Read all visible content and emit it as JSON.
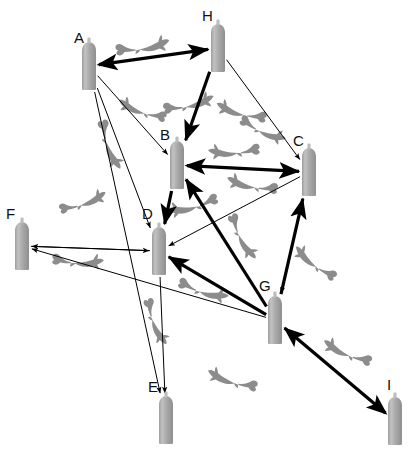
{
  "diagram": {
    "title": "",
    "kind": "directed-network-graph",
    "canvas": {
      "width": 414,
      "height": 449,
      "background": "#ffffff"
    },
    "style": {
      "node_fill": "#a6a6a6",
      "node_top_fill": "#bdbdbd",
      "edge_color": "#000000",
      "thin_edge_width": 1,
      "thick_edge_width": 3.2,
      "shark_color": "#8c8c8c",
      "label_color": "#111111"
    },
    "nodes": [
      {
        "id": "A",
        "label": "A",
        "x": 89,
        "y": 66,
        "label_x": 74,
        "label_y": 30
      },
      {
        "id": "B",
        "label": "B",
        "x": 177,
        "y": 165,
        "label_x": 160,
        "label_y": 127
      },
      {
        "id": "C",
        "label": "C",
        "x": 309,
        "y": 172,
        "label_x": 293,
        "label_y": 133
      },
      {
        "id": "D",
        "label": "D",
        "x": 159,
        "y": 251,
        "label_x": 142,
        "label_y": 206
      },
      {
        "id": "E",
        "label": "E",
        "x": 166,
        "y": 420,
        "label_x": 148,
        "label_y": 379
      },
      {
        "id": "F",
        "label": "F",
        "x": 22,
        "y": 246,
        "label_x": 6,
        "label_y": 206
      },
      {
        "id": "G",
        "label": "G",
        "x": 275,
        "y": 320,
        "label_x": 259,
        "label_y": 278
      },
      {
        "id": "H",
        "label": "H",
        "x": 218,
        "y": 48,
        "label_x": 202,
        "label_y": 8
      },
      {
        "id": "I",
        "label": "I",
        "x": 395,
        "y": 421,
        "label_x": 387,
        "label_y": 377
      }
    ],
    "edges": [
      {
        "from": "A",
        "to": "H",
        "weight": "thick",
        "arrows": "both"
      },
      {
        "from": "B",
        "to": "C",
        "weight": "thick",
        "arrows": "both"
      },
      {
        "from": "H",
        "to": "B",
        "weight": "thick",
        "arrows": "to"
      },
      {
        "from": "G",
        "to": "C",
        "weight": "thick",
        "arrows": "to"
      },
      {
        "from": "G",
        "to": "B",
        "weight": "thick",
        "arrows": "to"
      },
      {
        "from": "G",
        "to": "D",
        "weight": "thick",
        "arrows": "to"
      },
      {
        "from": "B",
        "to": "D",
        "weight": "thick",
        "arrows": "to"
      },
      {
        "from": "I",
        "to": "G",
        "weight": "thick",
        "arrows": "both"
      },
      {
        "from": "A",
        "to": "B",
        "weight": "thin",
        "arrows": "to"
      },
      {
        "from": "A",
        "to": "D",
        "weight": "thin",
        "arrows": "to"
      },
      {
        "from": "A",
        "to": "E",
        "weight": "thin",
        "arrows": "to"
      },
      {
        "from": "H",
        "to": "C",
        "weight": "thin",
        "arrows": "to"
      },
      {
        "from": "C",
        "to": "D",
        "weight": "thin",
        "arrows": "to"
      },
      {
        "from": "C",
        "to": "G",
        "weight": "thin",
        "arrows": "to"
      },
      {
        "from": "D",
        "to": "F",
        "weight": "thin",
        "arrows": "to"
      },
      {
        "from": "F",
        "to": "D",
        "weight": "thin",
        "arrows": "to"
      },
      {
        "from": "D",
        "to": "E",
        "weight": "thin",
        "arrows": "to"
      },
      {
        "from": "G",
        "to": "F",
        "weight": "thin",
        "arrows": "to"
      },
      {
        "from": "H",
        "to": "A",
        "weight": "thin",
        "arrows": "to"
      }
    ],
    "decorations": [
      {
        "kind": "shark",
        "x": 146,
        "y": 47,
        "scale": 1.0,
        "flip": false,
        "rot": -8
      },
      {
        "kind": "shark",
        "x": 139,
        "y": 110,
        "scale": 0.92,
        "flip": true,
        "rot": 18
      },
      {
        "kind": "shark",
        "x": 192,
        "y": 104,
        "scale": 0.95,
        "flip": false,
        "rot": -12
      },
      {
        "kind": "shark",
        "x": 238,
        "y": 112,
        "scale": 0.95,
        "flip": true,
        "rot": 14
      },
      {
        "kind": "shark",
        "x": 110,
        "y": 148,
        "scale": 0.95,
        "flip": false,
        "rot": 72
      },
      {
        "kind": "shark",
        "x": 231,
        "y": 152,
        "scale": 0.95,
        "flip": true,
        "rot": -4
      },
      {
        "kind": "shark",
        "x": 265,
        "y": 132,
        "scale": 0.9,
        "flip": false,
        "rot": 26
      },
      {
        "kind": "shark",
        "x": 249,
        "y": 185,
        "scale": 0.95,
        "flip": true,
        "rot": 10
      },
      {
        "kind": "shark",
        "x": 190,
        "y": 207,
        "scale": 0.95,
        "flip": true,
        "rot": -16
      },
      {
        "kind": "shark",
        "x": 86,
        "y": 202,
        "scale": 0.9,
        "flip": false,
        "rot": -18
      },
      {
        "kind": "shark",
        "x": 81,
        "y": 262,
        "scale": 0.95,
        "flip": false,
        "rot": 4
      },
      {
        "kind": "shark",
        "x": 243,
        "y": 240,
        "scale": 0.92,
        "flip": false,
        "rot": 64
      },
      {
        "kind": "shark",
        "x": 312,
        "y": 262,
        "scale": 0.92,
        "flip": true,
        "rot": 36
      },
      {
        "kind": "shark",
        "x": 206,
        "y": 292,
        "scale": 0.95,
        "flip": false,
        "rot": 18
      },
      {
        "kind": "shark",
        "x": 156,
        "y": 325,
        "scale": 0.9,
        "flip": false,
        "rot": 70
      },
      {
        "kind": "shark",
        "x": 344,
        "y": 352,
        "scale": 0.95,
        "flip": true,
        "rot": 22
      },
      {
        "kind": "shark",
        "x": 229,
        "y": 380,
        "scale": 0.95,
        "flip": true,
        "rot": 16
      }
    ]
  }
}
